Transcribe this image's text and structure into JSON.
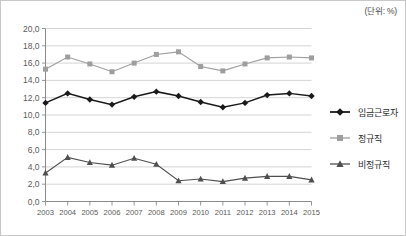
{
  "unit_label": "(단위: %)",
  "legend": {
    "position": "right",
    "items": [
      {
        "label": "임금근로자",
        "color": "#1a1a1a",
        "marker": "diamond-marker"
      },
      {
        "label": "정규직",
        "color": "#9e9e9e",
        "marker": "square-marker"
      },
      {
        "label": "비정규직",
        "color": "#4f4f4f",
        "marker": "triangle-marker"
      }
    ]
  },
  "chart_data": {
    "type": "line",
    "title": "",
    "subtitle": "",
    "xlabel": "",
    "ylabel": "",
    "unit": "%",
    "grid": true,
    "legend_position": "right",
    "ylim": [
      0.0,
      20.0
    ],
    "ytick_step": 2.0,
    "ytick_labels": [
      "0,0",
      "2,0",
      "4,0",
      "6,0",
      "8,0",
      "10,0",
      "12,0",
      "14,0",
      "16,0",
      "18,0",
      "20,0"
    ],
    "ytick_values": [
      0.0,
      2.0,
      4.0,
      6.0,
      8.0,
      10.0,
      12.0,
      14.0,
      16.0,
      18.0,
      20.0
    ],
    "categories": [
      "2003",
      "2004",
      "2005",
      "2006",
      "2007",
      "2008",
      "2009",
      "2010",
      "2011",
      "2012",
      "2013",
      "2014",
      "2015"
    ],
    "x": [
      2003,
      2004,
      2005,
      2006,
      2007,
      2008,
      2009,
      2010,
      2011,
      2012,
      2013,
      2014,
      2015
    ],
    "series": [
      {
        "name": "임금근로자",
        "color": "#1a1a1a",
        "marker": "diamond",
        "values": [
          11.4,
          12.5,
          11.8,
          11.2,
          12.1,
          12.7,
          12.2,
          11.5,
          10.9,
          11.4,
          12.3,
          12.5,
          12.2
        ]
      },
      {
        "name": "정규직",
        "color": "#9e9e9e",
        "marker": "square",
        "values": [
          15.3,
          16.7,
          15.9,
          15.0,
          16.0,
          17.0,
          17.3,
          15.6,
          15.1,
          15.9,
          16.6,
          16.7,
          16.6
        ]
      },
      {
        "name": "비정규직",
        "color": "#4f4f4f",
        "marker": "triangle",
        "values": [
          3.3,
          5.1,
          4.5,
          4.2,
          5.0,
          4.3,
          2.4,
          2.6,
          2.3,
          2.7,
          2.9,
          2.9,
          2.5
        ]
      }
    ]
  }
}
